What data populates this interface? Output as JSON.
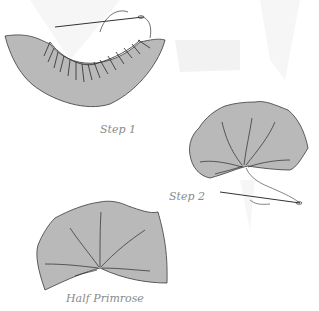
{
  "diagram": {
    "steps": [
      {
        "id": "step-1",
        "label": "Step 1",
        "description": "Gathered stitching along inner curve, needle and thread"
      },
      {
        "id": "step-2",
        "label": "Step 2",
        "description": "Thread pulled tight, gathered center with needle"
      },
      {
        "id": "result",
        "label": "Half Primrose",
        "description": "Finished half primrose shape"
      }
    ],
    "colors": {
      "fill": "#b9b9b9",
      "stroke": "#3a3a3a",
      "label": "#8a8a8a",
      "background_wash": "#ececec"
    }
  }
}
